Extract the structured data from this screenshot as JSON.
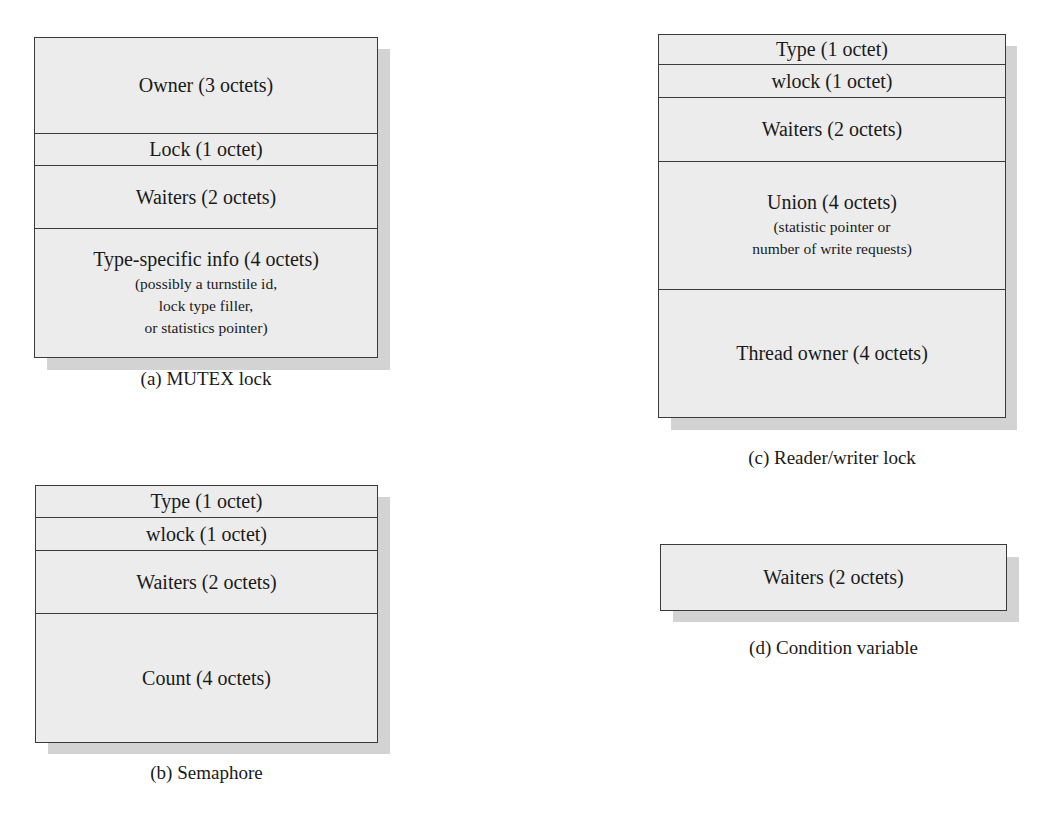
{
  "diagrams": {
    "mutex": {
      "caption": "(a) MUTEX lock",
      "fields": [
        {
          "label": "Owner (3 octets)"
        },
        {
          "label": "Lock (1 octet)"
        },
        {
          "label": "Waiters (2 octets)"
        },
        {
          "label": "Type-specific info (4 octets)",
          "notes": [
            "(possibly a turnstile id,",
            "lock type filler,",
            "or statistics pointer)"
          ]
        }
      ]
    },
    "semaphore": {
      "caption": "(b) Semaphore",
      "fields": [
        {
          "label": "Type (1 octet)"
        },
        {
          "label": "wlock (1 octet)"
        },
        {
          "label": "Waiters (2 octets)"
        },
        {
          "label": "Count (4 octets)"
        }
      ]
    },
    "rwlock": {
      "caption": "(c) Reader/writer lock",
      "fields": [
        {
          "label": "Type (1 octet)"
        },
        {
          "label": "wlock (1 octet)"
        },
        {
          "label": "Waiters (2 octets)"
        },
        {
          "label": "Union (4 octets)",
          "notes": [
            "(statistic pointer or",
            "number of write requests)"
          ]
        },
        {
          "label": "Thread owner (4 octets)"
        }
      ]
    },
    "condvar": {
      "caption": "(d) Condition variable",
      "fields": [
        {
          "label": "Waiters (2 octets)"
        }
      ]
    }
  },
  "colors": {
    "box_fill": "#ececec",
    "shadow": "#d3d3d3",
    "border": "#3a3a3a"
  }
}
